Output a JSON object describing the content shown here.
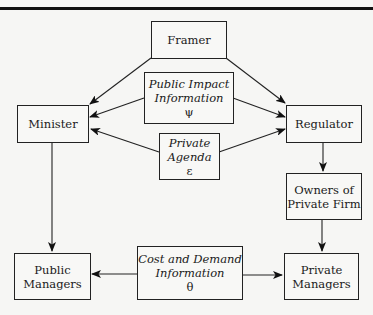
{
  "diagram": {
    "nodes": {
      "framer": {
        "label": "Framer"
      },
      "public_impact": {
        "line1": "Public Impact",
        "line2": "Information",
        "symbol": "ψ"
      },
      "minister": {
        "label": "Minister"
      },
      "regulator": {
        "label": "Regulator"
      },
      "private_agenda": {
        "line1": "Private",
        "line2": "Agenda",
        "symbol": "ε"
      },
      "owners": {
        "line1": "Owners of",
        "line2": "Private Firm"
      },
      "public_managers": {
        "line1": "Public",
        "line2": "Managers"
      },
      "cost_demand": {
        "line1": "Cost and Demand",
        "line2": "Information",
        "symbol": "θ"
      },
      "private_managers": {
        "line1": "Private",
        "line2": "Managers"
      }
    },
    "edges": [
      {
        "from": "Framer",
        "to": "Minister"
      },
      {
        "from": "Framer",
        "to": "Regulator"
      },
      {
        "from": "Public Impact Information",
        "to": "Minister"
      },
      {
        "from": "Public Impact Information",
        "to": "Regulator"
      },
      {
        "from": "Private Agenda",
        "to": "Minister"
      },
      {
        "from": "Private Agenda",
        "to": "Regulator"
      },
      {
        "from": "Regulator",
        "to": "Owners of Private Firm"
      },
      {
        "from": "Owners of Private Firm",
        "to": "Private Managers"
      },
      {
        "from": "Minister",
        "to": "Public Managers"
      },
      {
        "from": "Cost and Demand Information",
        "to": "Public Managers"
      },
      {
        "from": "Cost and Demand Information",
        "to": "Private Managers"
      }
    ]
  }
}
